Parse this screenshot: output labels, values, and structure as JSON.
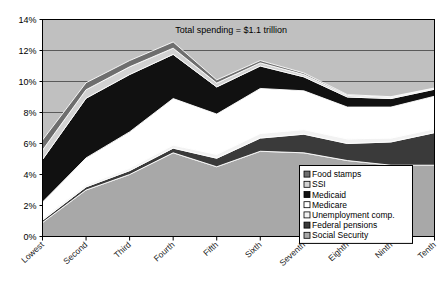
{
  "chart_data": {
    "type": "area",
    "title": "",
    "subtitle": "",
    "xlabel": "",
    "ylabel": "",
    "stacked": true,
    "grid": true,
    "legend_position": "inside-bottom-right",
    "ylim": [
      0,
      14
    ],
    "ytick_labels": [
      "0%",
      "2%",
      "4%",
      "6%",
      "8%",
      "10%",
      "12%",
      "14%"
    ],
    "ytick_values": [
      0,
      2,
      4,
      6,
      8,
      10,
      12,
      14
    ],
    "categories": [
      "Lowest",
      "Second",
      "Third",
      "Fourth",
      "Fifth",
      "Sixth",
      "Seventh",
      "Eighth",
      "Ninth",
      "Tenth"
    ],
    "annotations": [
      {
        "text": "Total spending = $1.1 trillion",
        "x_category": "Fourth",
        "y_value": 13.1
      }
    ],
    "series": [
      {
        "name": "Social Security",
        "color": "#a8a8a8",
        "values": [
          0.9,
          3.0,
          4.0,
          5.4,
          4.5,
          5.5,
          5.4,
          4.9,
          4.6,
          4.6
        ]
      },
      {
        "name": "Federal pensions",
        "color": "#3a3a3a",
        "values": [
          0.15,
          0.2,
          0.25,
          0.3,
          0.55,
          0.85,
          1.2,
          1.1,
          1.5,
          2.1
        ]
      },
      {
        "name": "Unemployment comp.",
        "color": "#f2f2f2",
        "values": [
          0.12,
          0.12,
          0.15,
          0.2,
          0.25,
          0.3,
          0.3,
          0.3,
          0.25,
          0.25
        ]
      },
      {
        "name": "Medicare",
        "color": "#ffffff",
        "values": [
          1.05,
          1.75,
          2.35,
          3.0,
          2.6,
          2.9,
          2.5,
          2.05,
          2.0,
          2.1
        ]
      },
      {
        "name": "Medicaid",
        "color": "#111111",
        "values": [
          2.75,
          3.85,
          3.7,
          2.85,
          1.75,
          1.45,
          0.9,
          0.65,
          0.55,
          0.45
        ]
      },
      {
        "name": "SSI",
        "color": "#d2d2d2",
        "values": [
          0.6,
          0.55,
          0.5,
          0.4,
          0.25,
          0.2,
          0.15,
          0.1,
          0.08,
          0.05
        ]
      },
      {
        "name": "Food stamps",
        "color": "#6e6e6e",
        "values": [
          0.65,
          0.45,
          0.4,
          0.4,
          0.2,
          0.15,
          0.1,
          0.05,
          0.04,
          0.03
        ]
      }
    ],
    "legend_entries": [
      {
        "label": "Food stamps",
        "color": "#6e6e6e"
      },
      {
        "label": "SSI",
        "color": "#d2d2d2"
      },
      {
        "label": "Medicaid",
        "color": "#111111"
      },
      {
        "label": "Medicare",
        "color": "#ffffff"
      },
      {
        "label": "Unemployment comp.",
        "color": "#f2f2f2"
      },
      {
        "label": "Federal pensions",
        "color": "#3a3a3a"
      },
      {
        "label": "Social Security",
        "color": "#a8a8a8"
      }
    ],
    "colors": {
      "plot_background": "#c0c0c0",
      "figure_background": "#ffffff",
      "gridline": "#5a5a5a",
      "axis": "#000000",
      "series_outline": "#ffffff",
      "legend_background": "#ffffff",
      "legend_border": "#000000"
    }
  }
}
